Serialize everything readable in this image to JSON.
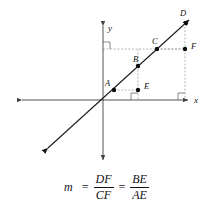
{
  "figure": {
    "type": "coordinate-geometry-diagram",
    "axes": {
      "x_label": "x",
      "y_label": "y",
      "origin": {
        "x": 103,
        "y": 100
      },
      "x_axis": {
        "x1": 17,
        "y1": 100,
        "x2": 192,
        "y2": 100,
        "arrows": "both"
      },
      "y_axis": {
        "x1": 103,
        "y1": 21,
        "x2": 103,
        "y2": 164,
        "arrows": "both"
      }
    },
    "line": {
      "name": "slope-line",
      "x1": 44,
      "y1": 152,
      "x2": 192,
      "y2": 17,
      "arrows": "both"
    },
    "points": [
      {
        "id": "A",
        "label": "A",
        "x": 114,
        "y": 90,
        "label_x": 106,
        "label_y": 81
      },
      {
        "id": "B",
        "label": "B",
        "x": 138,
        "y": 66,
        "label_x": 133,
        "label_y": 57
      },
      {
        "id": "C",
        "label": "C",
        "x": 157,
        "y": 49,
        "label_x": 152,
        "label_y": 39
      },
      {
        "id": "D",
        "label": "D",
        "x": 186,
        "y": 23,
        "label_x": 180,
        "label_y": 11
      },
      {
        "id": "E",
        "label": "E",
        "x": 138,
        "y": 90,
        "label_x": 144,
        "label_y": 83
      },
      {
        "id": "F",
        "label": "F",
        "x": 185,
        "y": 49,
        "label_x": 191,
        "label_y": 42
      }
    ],
    "dashed_segments": [
      {
        "name": "AE",
        "x1": 114,
        "y1": 90,
        "x2": 138,
        "y2": 90
      },
      {
        "name": "BE",
        "x1": 138,
        "y1": 66,
        "x2": 138,
        "y2": 90
      },
      {
        "name": "CF",
        "x1": 157,
        "y1": 49,
        "x2": 185,
        "y2": 49
      },
      {
        "name": "DF",
        "x1": 185,
        "y1": 23,
        "x2": 185,
        "y2": 49
      },
      {
        "name": "top-horizontal",
        "x1": 103,
        "y1": 49,
        "x2": 185,
        "y2": 49
      },
      {
        "name": "E-to-axis",
        "x1": 138,
        "y1": 90,
        "x2": 138,
        "y2": 100
      },
      {
        "name": "F-to-axis",
        "x1": 185,
        "y1": 49,
        "x2": 185,
        "y2": 100
      }
    ],
    "right_angle_marks": [
      {
        "name": "origin-upper-left",
        "x": 103,
        "y": 42,
        "w": 7,
        "h": 7,
        "corner": "tl"
      },
      {
        "name": "at-E-on-axis",
        "x": 131,
        "y": 93,
        "w": 7,
        "h": 7,
        "corner": "br"
      },
      {
        "name": "at-F-on-axis",
        "x": 178,
        "y": 93,
        "w": 7,
        "h": 7,
        "corner": "br"
      }
    ],
    "colors": {
      "ink": "#111111",
      "axis": "#555555",
      "dashed": "#9a9a9a",
      "background": "#ffffff"
    }
  },
  "formula": {
    "variable": "m",
    "equals": "=",
    "fraction1": {
      "numerator": "DF",
      "denominator": "CF"
    },
    "fraction2": {
      "numerator": "BE",
      "denominator": "AE"
    },
    "plain_text": "m = DF/CF = BE/AE"
  }
}
